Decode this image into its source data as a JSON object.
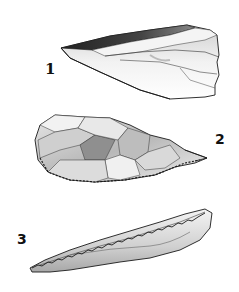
{
  "figure": {
    "artifacts": [
      {
        "id": 1,
        "label": "1",
        "kind": "blade / flake"
      },
      {
        "id": 2,
        "label": "2",
        "kind": "retouched point"
      },
      {
        "id": 3,
        "label": "3",
        "kind": "denticulate blade"
      }
    ]
  },
  "colors": {
    "ink": "#1a1a1a",
    "shade_dark": "#555555",
    "shade_mid": "#9a9a9a",
    "shade_light": "#d6d6d6",
    "paper": "#ffffff"
  }
}
